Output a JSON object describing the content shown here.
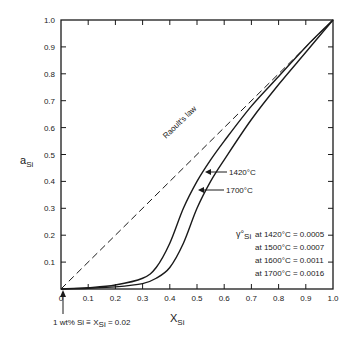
{
  "chart_data": {
    "type": "line",
    "title": "",
    "xlabel": "X",
    "xlabel_sub": "Si",
    "ylabel": "a",
    "ylabel_sub": "Si",
    "xlim": [
      0,
      1.0
    ],
    "ylim": [
      0,
      1.0
    ],
    "grid": false,
    "x_ticks": [
      "0",
      "0.1",
      "0.2",
      "0.3",
      "0.4",
      "0.5",
      "0.6",
      "0.7",
      "0.8",
      "0.9",
      "1.0"
    ],
    "y_ticks": [
      "0.1",
      "0.2",
      "0.3",
      "0.4",
      "0.5",
      "0.6",
      "0.7",
      "0.8",
      "0.9",
      "1.0"
    ],
    "series": [
      {
        "name": "Raoult's law",
        "style": "dashed",
        "x": [
          0,
          1.0
        ],
        "y": [
          0,
          1.0
        ]
      },
      {
        "name": "1700°C",
        "style": "solid",
        "x": [
          0,
          0.1,
          0.2,
          0.3,
          0.35,
          0.4,
          0.45,
          0.5,
          0.55,
          0.6,
          0.7,
          0.8,
          0.9,
          1.0
        ],
        "y": [
          0,
          0.005,
          0.015,
          0.04,
          0.08,
          0.17,
          0.3,
          0.4,
          0.48,
          0.55,
          0.68,
          0.79,
          0.9,
          1.0
        ]
      },
      {
        "name": "1420°C",
        "style": "solid",
        "x": [
          0,
          0.1,
          0.2,
          0.3,
          0.35,
          0.4,
          0.45,
          0.5,
          0.55,
          0.6,
          0.7,
          0.8,
          0.9,
          1.0
        ],
        "y": [
          0,
          0.003,
          0.008,
          0.02,
          0.04,
          0.08,
          0.17,
          0.3,
          0.4,
          0.48,
          0.63,
          0.76,
          0.88,
          1.0
        ]
      }
    ],
    "annotations": {
      "raoult_label": "Raoult's law",
      "curve_label_1420": "1420°C",
      "curve_label_1700": "1700°C",
      "gamma_prefix": "γ°",
      "gamma_sub": "Si",
      "gamma_values": [
        {
          "label": "at 1420°C = 0.0005",
          "temperature_c": 1420,
          "value": 0.0005
        },
        {
          "label": "at 1500°C = 0.0007",
          "temperature_c": 1500,
          "value": 0.0007
        },
        {
          "label": "at 1600°C = 0.0011",
          "temperature_c": 1600,
          "value": 0.0011
        },
        {
          "label": "at 1700°C = 0.0016",
          "temperature_c": 1700,
          "value": 0.0016
        }
      ],
      "footnote_left": "1 wt% Si  ≡  X",
      "footnote_sub": "Si",
      "footnote_right": " = 0.02"
    }
  }
}
